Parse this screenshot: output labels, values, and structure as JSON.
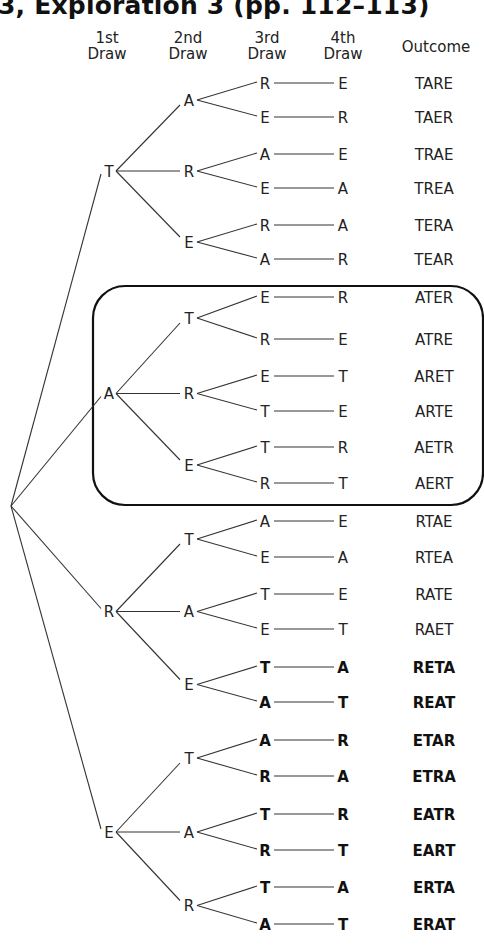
{
  "title": "3, Exploration 3 (pp. 112–113)",
  "headers": {
    "draw1": [
      "1st",
      "Draw"
    ],
    "draw2": [
      "2nd",
      "Draw"
    ],
    "draw3": [
      "3rd",
      "Draw"
    ],
    "draw4": [
      "4th",
      "Draw"
    ],
    "outcome": "Outcome"
  },
  "highlight_box": {
    "encloses_first_draw": "A",
    "stroke": "#111111"
  },
  "tree": [
    {
      "first": "T",
      "branches": [
        {
          "second": "A",
          "leaves": [
            {
              "third": "R",
              "fourth": "E",
              "outcome": "TARE",
              "bold": false
            },
            {
              "third": "E",
              "fourth": "R",
              "outcome": "TAER",
              "bold": false
            }
          ]
        },
        {
          "second": "R",
          "leaves": [
            {
              "third": "A",
              "fourth": "E",
              "outcome": "TRAE",
              "bold": false
            },
            {
              "third": "E",
              "fourth": "A",
              "outcome": "TREA",
              "bold": false
            }
          ]
        },
        {
          "second": "E",
          "leaves": [
            {
              "third": "R",
              "fourth": "A",
              "outcome": "TERA",
              "bold": false
            },
            {
              "third": "A",
              "fourth": "R",
              "outcome": "TEAR",
              "bold": false
            }
          ]
        }
      ]
    },
    {
      "first": "A",
      "branches": [
        {
          "second": "T",
          "leaves": [
            {
              "third": "E",
              "fourth": "R",
              "outcome": "ATER",
              "bold": false
            },
            {
              "third": "R",
              "fourth": "E",
              "outcome": "ATRE",
              "bold": false
            }
          ]
        },
        {
          "second": "R",
          "leaves": [
            {
              "third": "E",
              "fourth": "T",
              "outcome": "ARET",
              "bold": false
            },
            {
              "third": "T",
              "fourth": "E",
              "outcome": "ARTE",
              "bold": false
            }
          ]
        },
        {
          "second": "E",
          "leaves": [
            {
              "third": "T",
              "fourth": "R",
              "outcome": "AETR",
              "bold": false
            },
            {
              "third": "R",
              "fourth": "T",
              "outcome": "AERT",
              "bold": false
            }
          ]
        }
      ]
    },
    {
      "first": "R",
      "branches": [
        {
          "second": "T",
          "leaves": [
            {
              "third": "A",
              "fourth": "E",
              "outcome": "RTAE",
              "bold": false
            },
            {
              "third": "E",
              "fourth": "A",
              "outcome": "RTEA",
              "bold": false
            }
          ]
        },
        {
          "second": "A",
          "leaves": [
            {
              "third": "T",
              "fourth": "E",
              "outcome": "RATE",
              "bold": false
            },
            {
              "third": "E",
              "fourth": "T",
              "outcome": "RAET",
              "bold": false
            }
          ]
        },
        {
          "second": "E",
          "leaves": [
            {
              "third": "T",
              "fourth": "A",
              "outcome": "RETA",
              "bold": true
            },
            {
              "third": "A",
              "fourth": "T",
              "outcome": "REAT",
              "bold": true
            }
          ]
        }
      ]
    },
    {
      "first": "E",
      "branches": [
        {
          "second": "T",
          "leaves": [
            {
              "third": "A",
              "fourth": "R",
              "outcome": "ETAR",
              "bold": true
            },
            {
              "third": "R",
              "fourth": "A",
              "outcome": "ETRA",
              "bold": true
            }
          ]
        },
        {
          "second": "A",
          "leaves": [
            {
              "third": "T",
              "fourth": "R",
              "outcome": "EATR",
              "bold": true
            },
            {
              "third": "R",
              "fourth": "T",
              "outcome": "EART",
              "bold": true
            }
          ]
        },
        {
          "second": "R",
          "leaves": [
            {
              "third": "T",
              "fourth": "A",
              "outcome": "ERTA",
              "bold": true
            },
            {
              "third": "A",
              "fourth": "T",
              "outcome": "ERAT",
              "bold": true
            }
          ]
        }
      ]
    }
  ]
}
